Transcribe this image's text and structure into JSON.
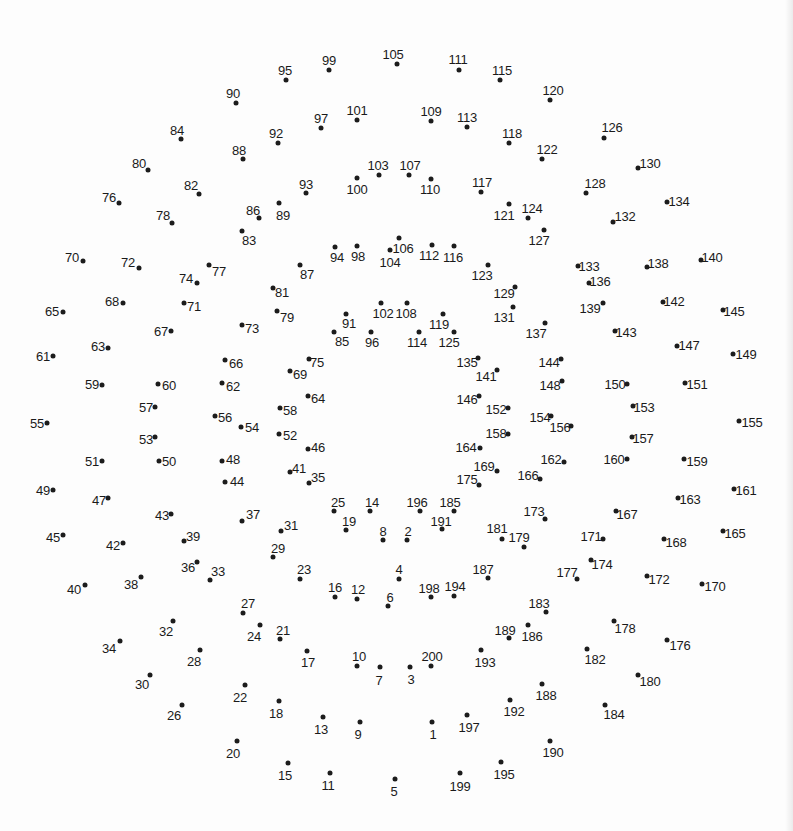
{
  "puzzle": {
    "type": "connect-the-dots",
    "dot_count": 200,
    "first_number": 1,
    "last_number": 200,
    "background_color": "#fdfdfd",
    "dot_color": "#1c1c1c",
    "label_color": "#1a1a1a",
    "dots_format": [
      "number",
      "dot_x",
      "dot_y",
      "label_x",
      "label_y"
    ],
    "dots": [
      [
        1,
        432,
        722,
        433,
        734
      ],
      [
        2,
        407,
        540,
        408,
        531
      ],
      [
        3,
        410,
        667,
        411,
        679
      ],
      [
        4,
        399,
        579,
        399,
        569
      ],
      [
        5,
        395,
        779,
        394,
        791
      ],
      [
        6,
        388,
        606,
        390,
        597
      ],
      [
        7,
        380,
        667,
        379,
        680
      ],
      [
        8,
        383,
        540,
        383,
        531
      ],
      [
        9,
        360,
        722,
        358,
        734
      ],
      [
        10,
        357,
        666,
        359,
        656
      ],
      [
        11,
        330,
        773,
        328,
        785
      ],
      [
        12,
        357,
        599,
        358,
        589
      ],
      [
        13,
        323,
        717,
        321,
        729
      ],
      [
        14,
        370,
        511,
        372,
        502
      ],
      [
        15,
        288,
        763,
        285,
        775
      ],
      [
        16,
        335,
        597,
        335,
        587
      ],
      [
        17,
        307,
        651,
        308,
        662
      ],
      [
        18,
        279,
        701,
        276,
        713
      ],
      [
        19,
        346,
        530,
        349,
        521
      ],
      [
        20,
        237,
        741,
        233,
        753
      ],
      [
        21,
        280,
        639,
        283,
        630
      ],
      [
        22,
        245,
        685,
        240,
        697
      ],
      [
        23,
        300,
        579,
        304,
        569
      ],
      [
        24,
        260,
        625,
        254,
        636
      ],
      [
        25,
        334,
        511,
        338,
        502
      ],
      [
        26,
        182,
        705,
        174,
        715
      ],
      [
        27,
        243,
        613,
        248,
        603
      ],
      [
        28,
        200,
        650,
        194,
        661
      ],
      [
        29,
        273,
        557,
        278,
        548
      ],
      [
        30,
        150,
        675,
        142,
        684
      ],
      [
        31,
        281,
        531,
        291,
        525
      ],
      [
        32,
        173,
        621,
        166,
        631
      ],
      [
        33,
        210,
        580,
        218,
        571
      ],
      [
        34,
        120,
        641,
        109,
        648
      ],
      [
        35,
        309,
        483,
        318,
        477
      ],
      [
        36,
        197,
        562,
        188,
        567
      ],
      [
        37,
        242,
        521,
        253,
        514
      ],
      [
        38,
        141,
        577,
        131,
        584
      ],
      [
        39,
        184,
        541,
        193,
        536
      ],
      [
        40,
        85,
        585,
        74,
        589
      ],
      [
        41,
        290,
        472,
        299,
        468
      ],
      [
        42,
        123,
        543,
        113,
        545
      ],
      [
        43,
        171,
        514,
        162,
        515
      ],
      [
        44,
        225,
        482,
        237,
        481
      ],
      [
        45,
        63,
        535,
        53,
        537
      ],
      [
        46,
        308,
        449,
        318,
        447
      ],
      [
        47,
        108,
        498,
        99,
        500
      ],
      [
        48,
        222,
        461,
        233,
        459
      ],
      [
        49,
        53,
        490,
        43,
        490
      ],
      [
        50,
        159,
        461,
        169,
        461
      ],
      [
        51,
        102,
        461,
        92,
        461
      ],
      [
        52,
        279,
        434,
        290,
        435
      ],
      [
        53,
        155,
        437,
        146,
        439
      ],
      [
        54,
        241,
        427,
        252,
        427
      ],
      [
        55,
        47,
        423,
        37,
        423
      ],
      [
        56,
        215,
        416,
        225,
        417
      ],
      [
        57,
        155,
        407,
        146,
        407
      ],
      [
        58,
        280,
        408,
        290,
        410
      ],
      [
        59,
        102,
        385,
        92,
        384
      ],
      [
        60,
        158,
        384,
        169,
        385
      ],
      [
        61,
        53,
        356,
        43,
        356
      ],
      [
        62,
        222,
        383,
        233,
        386
      ],
      [
        63,
        108,
        348,
        98,
        346
      ],
      [
        64,
        308,
        396,
        318,
        398
      ],
      [
        65,
        63,
        312,
        52,
        311
      ],
      [
        66,
        225,
        360,
        236,
        363
      ],
      [
        67,
        171,
        331,
        161,
        331
      ],
      [
        68,
        123,
        303,
        112,
        301
      ],
      [
        69,
        290,
        371,
        300,
        374
      ],
      [
        70,
        83,
        261,
        72,
        257
      ],
      [
        71,
        184,
        303,
        194,
        306
      ],
      [
        72,
        139,
        268,
        128,
        262
      ],
      [
        73,
        242,
        325,
        252,
        328
      ],
      [
        74,
        197,
        283,
        186,
        278
      ],
      [
        75,
        309,
        359,
        317,
        362
      ],
      [
        76,
        119,
        203,
        109,
        197
      ],
      [
        77,
        209,
        265,
        219,
        271
      ],
      [
        78,
        172,
        223,
        163,
        215
      ],
      [
        79,
        277,
        311,
        287,
        317
      ],
      [
        80,
        148,
        170,
        139,
        163
      ],
      [
        81,
        273,
        288,
        282,
        292
      ],
      [
        82,
        199,
        194,
        191,
        185
      ],
      [
        83,
        242,
        231,
        249,
        240
      ],
      [
        84,
        181,
        139,
        177,
        130
      ],
      [
        85,
        334,
        332,
        342,
        341
      ],
      [
        86,
        259,
        218,
        253,
        210
      ],
      [
        87,
        300,
        265,
        307,
        274
      ],
      [
        88,
        243,
        159,
        239,
        150
      ],
      [
        89,
        279,
        203,
        283,
        215
      ],
      [
        90,
        236,
        103,
        233,
        93
      ],
      [
        91,
        346,
        314,
        349,
        323
      ],
      [
        92,
        278,
        143,
        276,
        133
      ],
      [
        93,
        306,
        193,
        306,
        184
      ],
      [
        94,
        335,
        247,
        337,
        257
      ],
      [
        95,
        286,
        80,
        285,
        70
      ],
      [
        96,
        371,
        332,
        372,
        342
      ],
      [
        97,
        321,
        128,
        321,
        118
      ],
      [
        98,
        357,
        246,
        358,
        256
      ],
      [
        99,
        329,
        70,
        329,
        60
      ],
      [
        100,
        357,
        178,
        357,
        189
      ],
      [
        101,
        357,
        120,
        357,
        110
      ],
      [
        102,
        381,
        303,
        383,
        313
      ],
      [
        103,
        379,
        175,
        378,
        165
      ],
      [
        104,
        390,
        250,
        390,
        262
      ],
      [
        105,
        397,
        64,
        393,
        54
      ],
      [
        106,
        399,
        238,
        403,
        248
      ],
      [
        107,
        409,
        175,
        410,
        165
      ],
      [
        108,
        407,
        303,
        406,
        313
      ],
      [
        109,
        431,
        121,
        431,
        111
      ],
      [
        110,
        431,
        179,
        430,
        189
      ],
      [
        111,
        459,
        70,
        458,
        59
      ],
      [
        112,
        432,
        245,
        429,
        255
      ],
      [
        113,
        467,
        127,
        467,
        117
      ],
      [
        114,
        419,
        332,
        417,
        342
      ],
      [
        115,
        500,
        80,
        502,
        70
      ],
      [
        116,
        454,
        246,
        453,
        257
      ],
      [
        117,
        481,
        192,
        482,
        182
      ],
      [
        118,
        509,
        143,
        512,
        133
      ],
      [
        119,
        443,
        314,
        439,
        324
      ],
      [
        120,
        550,
        100,
        553,
        90
      ],
      [
        121,
        509,
        204,
        504,
        215
      ],
      [
        122,
        542,
        159,
        547,
        149
      ],
      [
        123,
        488,
        265,
        482,
        275
      ],
      [
        124,
        528,
        218,
        532,
        208
      ],
      [
        125,
        454,
        332,
        449,
        342
      ],
      [
        126,
        604,
        138,
        612,
        127
      ],
      [
        127,
        544,
        230,
        539,
        240
      ],
      [
        128,
        586,
        193,
        595,
        183
      ],
      [
        129,
        515,
        287,
        504,
        293
      ],
      [
        130,
        638,
        168,
        650,
        163
      ],
      [
        131,
        513,
        307,
        504,
        317
      ],
      [
        132,
        613,
        222,
        625,
        216
      ],
      [
        133,
        578,
        266,
        589,
        266
      ],
      [
        134,
        667,
        202,
        679,
        201
      ],
      [
        135,
        478,
        358,
        467,
        362
      ],
      [
        136,
        589,
        283,
        600,
        281
      ],
      [
        137,
        545,
        323,
        536,
        333
      ],
      [
        138,
        647,
        267,
        658,
        263
      ],
      [
        139,
        603,
        303,
        590,
        308
      ],
      [
        140,
        701,
        260,
        712,
        257
      ],
      [
        141,
        497,
        370,
        486,
        376
      ],
      [
        142,
        663,
        302,
        674,
        301
      ],
      [
        143,
        615,
        331,
        626,
        332
      ],
      [
        144,
        561,
        359,
        549,
        362
      ],
      [
        145,
        723,
        310,
        734,
        311
      ],
      [
        146,
        479,
        396,
        467,
        399
      ],
      [
        147,
        677,
        346,
        689,
        345
      ],
      [
        148,
        562,
        381,
        550,
        385
      ],
      [
        149,
        733,
        354,
        746,
        354
      ],
      [
        150,
        627,
        384,
        615,
        384
      ],
      [
        151,
        685,
        383,
        697,
        384
      ],
      [
        152,
        508,
        408,
        496,
        409
      ],
      [
        153,
        633,
        406,
        644,
        407
      ],
      [
        154,
        551,
        416,
        540,
        417
      ],
      [
        155,
        739,
        421,
        752,
        422
      ],
      [
        156,
        571,
        426,
        560,
        427
      ],
      [
        157,
        632,
        437,
        643,
        438
      ],
      [
        158,
        508,
        434,
        496,
        433
      ],
      [
        159,
        684,
        459,
        697,
        461
      ],
      [
        160,
        627,
        459,
        614,
        459
      ],
      [
        161,
        734,
        489,
        746,
        490
      ],
      [
        162,
        564,
        462,
        551,
        459
      ],
      [
        163,
        678,
        498,
        690,
        499
      ],
      [
        164,
        480,
        448,
        466,
        447
      ],
      [
        165,
        723,
        531,
        735,
        533
      ],
      [
        166,
        540,
        479,
        528,
        475
      ],
      [
        167,
        616,
        511,
        627,
        514
      ],
      [
        168,
        664,
        539,
        676,
        542
      ],
      [
        169,
        497,
        471,
        484,
        466
      ],
      [
        170,
        702,
        584,
        715,
        586
      ],
      [
        171,
        603,
        539,
        591,
        536
      ],
      [
        172,
        647,
        576,
        659,
        579
      ],
      [
        173,
        545,
        519,
        534,
        511
      ],
      [
        174,
        591,
        560,
        602,
        564
      ],
      [
        175,
        479,
        485,
        467,
        479
      ],
      [
        176,
        667,
        640,
        680,
        645
      ],
      [
        177,
        577,
        579,
        567,
        572
      ],
      [
        178,
        614,
        621,
        625,
        628
      ],
      [
        179,
        524,
        547,
        519,
        537
      ],
      [
        180,
        638,
        675,
        650,
        681
      ],
      [
        181,
        502,
        539,
        497,
        528
      ],
      [
        182,
        587,
        649,
        595,
        659
      ],
      [
        183,
        546,
        612,
        539,
        603
      ],
      [
        184,
        605,
        705,
        614,
        714
      ],
      [
        185,
        454,
        511,
        450,
        502
      ],
      [
        186,
        528,
        625,
        532,
        636
      ],
      [
        187,
        488,
        578,
        483,
        569
      ],
      [
        188,
        542,
        684,
        546,
        695
      ],
      [
        189,
        509,
        638,
        505,
        630
      ],
      [
        190,
        550,
        741,
        553,
        752
      ],
      [
        191,
        442,
        529,
        441,
        521
      ],
      [
        192,
        510,
        700,
        514,
        711
      ],
      [
        193,
        481,
        650,
        485,
        662
      ],
      [
        194,
        454,
        596,
        455,
        586
      ],
      [
        195,
        501,
        762,
        504,
        774
      ],
      [
        196,
        420,
        511,
        417,
        502
      ],
      [
        197,
        467,
        715,
        469,
        727
      ],
      [
        198,
        431,
        597,
        429,
        588
      ],
      [
        199,
        460,
        773,
        460,
        786
      ],
      [
        200,
        431,
        666,
        432,
        656
      ]
    ]
  }
}
